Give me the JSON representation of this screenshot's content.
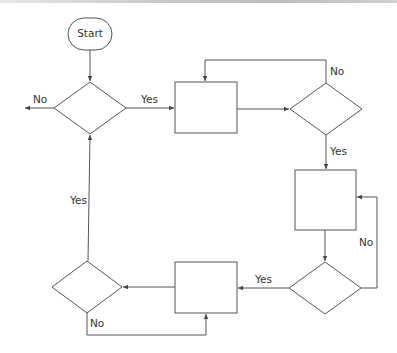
{
  "diagram": {
    "type": "flowchart",
    "start": {
      "label": "Start"
    },
    "labels": {
      "d1_no": "No",
      "d1_yes": "Yes",
      "d2_no": "No",
      "d2_yes": "Yes",
      "d3_no": "No",
      "d3_yes": "Yes",
      "d4_yes": "Yes",
      "d4_no": "No"
    },
    "nodes": [
      {
        "id": "start",
        "kind": "terminator",
        "label": "Start"
      },
      {
        "id": "decision-1",
        "kind": "decision",
        "label": ""
      },
      {
        "id": "process-1",
        "kind": "process",
        "label": ""
      },
      {
        "id": "decision-2",
        "kind": "decision",
        "label": ""
      },
      {
        "id": "process-2",
        "kind": "process",
        "label": ""
      },
      {
        "id": "decision-3",
        "kind": "decision",
        "label": ""
      },
      {
        "id": "process-3",
        "kind": "process",
        "label": ""
      },
      {
        "id": "decision-4",
        "kind": "decision",
        "label": ""
      }
    ],
    "edges": [
      {
        "from": "start",
        "to": "decision-1",
        "label": ""
      },
      {
        "from": "decision-1",
        "to": "exit-left",
        "label": "No"
      },
      {
        "from": "decision-1",
        "to": "process-1",
        "label": "Yes"
      },
      {
        "from": "process-1",
        "to": "decision-2",
        "label": ""
      },
      {
        "from": "decision-2",
        "to": "process-1",
        "label": "No"
      },
      {
        "from": "decision-2",
        "to": "process-2",
        "label": "Yes"
      },
      {
        "from": "process-2",
        "to": "decision-3",
        "label": ""
      },
      {
        "from": "decision-3",
        "to": "process-2",
        "label": "No"
      },
      {
        "from": "decision-3",
        "to": "process-3",
        "label": "Yes"
      },
      {
        "from": "process-3",
        "to": "decision-4",
        "label": ""
      },
      {
        "from": "decision-4",
        "to": "decision-1",
        "label": "Yes"
      },
      {
        "from": "decision-4",
        "to": "process-3",
        "label": "No"
      }
    ],
    "colors": {
      "stroke": "#555555",
      "text": "#333333",
      "background": "#ffffff"
    }
  }
}
